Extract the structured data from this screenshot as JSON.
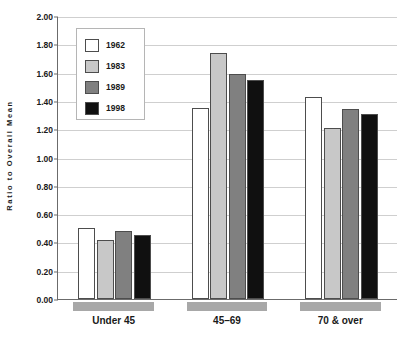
{
  "chart_data": {
    "type": "bar",
    "title": "",
    "xlabel": "",
    "ylabel": "Ratio to Overall Mean",
    "ylim": [
      0.0,
      2.0
    ],
    "ytick_step": 0.2,
    "grid": true,
    "legend_position": "upper-left-inside",
    "categories": [
      "Under 45",
      "45–69",
      "70 & over"
    ],
    "ytick_labels": [
      "2.00",
      "1.80",
      "1.60",
      "1.40",
      "1.20",
      "1.00",
      "0.80",
      "0.60",
      "0.40",
      "0.20",
      "0.00"
    ],
    "ytick_values": [
      2.0,
      1.8,
      1.6,
      1.4,
      1.2,
      1.0,
      0.8,
      0.6,
      0.4,
      0.2,
      0.0
    ],
    "series": [
      {
        "name": "1962",
        "color": "#ffffff",
        "values": [
          0.5,
          1.35,
          1.43
        ]
      },
      {
        "name": "1983",
        "color": "#c8c8c8",
        "values": [
          0.42,
          1.74,
          1.21
        ]
      },
      {
        "name": "1989",
        "color": "#808080",
        "values": [
          0.48,
          1.59,
          1.34
        ]
      },
      {
        "name": "1998",
        "color": "#101010",
        "values": [
          0.45,
          1.55,
          1.31
        ]
      }
    ]
  },
  "legend": {
    "entries": [
      {
        "label": "1962",
        "color": "#ffffff"
      },
      {
        "label": "1983",
        "color": "#c8c8c8"
      },
      {
        "label": "1989",
        "color": "#808080"
      },
      {
        "label": "1998",
        "color": "#101010"
      }
    ]
  },
  "axes": {
    "y_title": "Ratio to Overall Mean"
  },
  "colors": {
    "grid": "#cfcfcf",
    "axis": "#6b6b6b",
    "bar_outline": "#4d4d4d",
    "group_band": "#a8a8a8",
    "text": "#1a1a1a"
  }
}
